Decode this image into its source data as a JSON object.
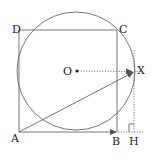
{
  "diagram": {
    "type": "geometry",
    "colors": {
      "stroke": "#555555",
      "text": "#222222",
      "background": "#ffffff"
    },
    "labels": {
      "A": "A",
      "B": "B",
      "C": "C",
      "D": "D",
      "O": "O",
      "X": "X",
      "H": "H"
    },
    "points": {
      "A": [
        19,
        132
      ],
      "B": [
        117,
        132
      ],
      "C": [
        117,
        30
      ],
      "D": [
        19,
        30
      ],
      "O": [
        76,
        71
      ],
      "X": [
        134,
        72
      ],
      "H": [
        134,
        132
      ]
    },
    "circle": {
      "center": "O",
      "radius": 59
    },
    "segments": [
      {
        "from": "A",
        "to": "B",
        "style": "solid",
        "arrow": true
      },
      {
        "from": "B",
        "to": "C",
        "style": "solid"
      },
      {
        "from": "C",
        "to": "D",
        "style": "solid"
      },
      {
        "from": "D",
        "to": "A",
        "style": "solid"
      },
      {
        "from": "A",
        "to": "X",
        "style": "solid",
        "arrow": true
      },
      {
        "from": "O",
        "to": "X",
        "style": "dotted",
        "arrow": true
      },
      {
        "from": "X",
        "to": "H",
        "style": "dotted"
      },
      {
        "from": "B",
        "to": "H",
        "style": "dotted"
      }
    ],
    "right_angle_at": "H"
  }
}
